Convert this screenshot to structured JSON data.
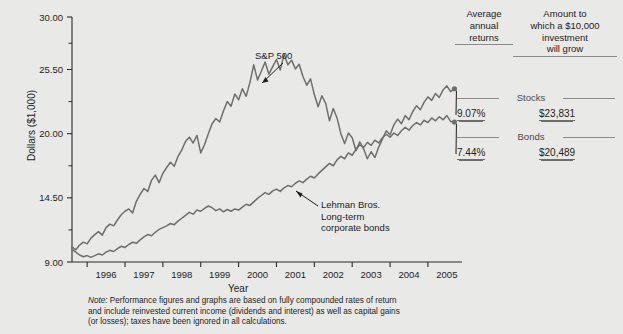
{
  "figure": {
    "background_color": "#e9e9e7",
    "line_color": "#6e6e6e",
    "axis_color": "#2a2a2a"
  },
  "annotations": {
    "sp500": {
      "text": "S&P 500"
    },
    "bonds": {
      "line1": "Lehman Bros.",
      "line2": "Long-term",
      "line3": "corporate bonds"
    }
  },
  "panel": {
    "headers": {
      "returns": {
        "line1": "Average",
        "line2": "annual",
        "line3": "returns"
      },
      "growth": {
        "line1": "Amount to",
        "line2": "which a $10,000",
        "line3": "investment",
        "line4": "will grow"
      }
    },
    "rows": [
      {
        "name": "Stocks",
        "return": "9.07%",
        "amount": "$23,831"
      },
      {
        "name": "Bonds",
        "return": "7.44%",
        "amount": "$20,489"
      }
    ]
  },
  "footnote": {
    "lead": "Note:",
    "line1": " Performance figures and graphs are based on fully compounded rates of return",
    "line2": "and include reinvested current income (dividends and interest) as well as capital gains",
    "line3": "(or losses); taxes have been ignored in all calculations."
  },
  "chart_data": {
    "type": "line",
    "title": "",
    "xlabel": "Year",
    "ylabel": "Dollars ($1,000)",
    "xlim": [
      1995.6,
      2005.9
    ],
    "ylim": [
      9.0,
      30.0
    ],
    "yticks": [
      9.0,
      14.5,
      20.0,
      25.5,
      30.0
    ],
    "ytick_labels": [
      "9.00",
      "14.50",
      "20.00",
      "25.50",
      "30.00"
    ],
    "yminor_ticks": [
      11.75,
      17.25,
      22.75,
      27.75
    ],
    "xticks": [
      1996,
      1997,
      1998,
      1999,
      2000,
      2001,
      2002,
      2003,
      2004,
      2005,
      2006
    ],
    "xtick_labels": [
      "1996",
      "1997",
      "1998",
      "1999",
      "2000",
      "2001",
      "2002",
      "2003",
      "2004",
      "2005"
    ],
    "grid": false,
    "legend": "annotated-inline",
    "series": [
      {
        "name": "S&P 500",
        "color": "#6e6e6e",
        "end_marker": true,
        "x": [
          1995.6,
          1995.7,
          1995.8,
          1995.9,
          1996.0,
          1996.1,
          1996.2,
          1996.3,
          1996.4,
          1996.5,
          1996.6,
          1996.7,
          1996.8,
          1996.9,
          1997.0,
          1997.1,
          1997.2,
          1997.3,
          1997.4,
          1997.5,
          1997.6,
          1997.7,
          1997.8,
          1997.9,
          1998.0,
          1998.1,
          1998.2,
          1998.3,
          1998.4,
          1998.5,
          1998.6,
          1998.7,
          1998.8,
          1998.9,
          1999.0,
          1999.1,
          1999.2,
          1999.3,
          1999.4,
          1999.5,
          1999.6,
          1999.7,
          1999.8,
          1999.9,
          2000.0,
          2000.1,
          2000.2,
          2000.3,
          2000.4,
          2000.5,
          2000.6,
          2000.7,
          2000.8,
          2000.9,
          2001.0,
          2001.1,
          2001.2,
          2001.3,
          2001.4,
          2001.5,
          2001.6,
          2001.7,
          2001.8,
          2001.9,
          2002.0,
          2002.1,
          2002.2,
          2002.3,
          2002.4,
          2002.5,
          2002.6,
          2002.7,
          2002.8,
          2002.9,
          2003.0,
          2003.1,
          2003.2,
          2003.3,
          2003.4,
          2003.5,
          2003.6,
          2003.7,
          2003.8,
          2003.9,
          2004.0,
          2004.1,
          2004.2,
          2004.3,
          2004.4,
          2004.5,
          2004.6,
          2004.7,
          2004.8,
          2004.9,
          2005.0,
          2005.1,
          2005.2,
          2005.3,
          2005.4,
          2005.5,
          2005.6,
          2005.7
        ],
        "y": [
          10.3,
          10.05,
          10.45,
          10.7,
          10.55,
          11.05,
          11.35,
          11.6,
          11.3,
          11.95,
          12.25,
          12.1,
          12.6,
          13.05,
          13.35,
          13.55,
          13.2,
          14.2,
          14.8,
          15.3,
          15.05,
          16.0,
          16.45,
          15.8,
          16.6,
          17.1,
          17.55,
          17.2,
          18.05,
          18.6,
          19.35,
          19.7,
          19.2,
          19.85,
          18.35,
          19.05,
          20.0,
          20.85,
          21.3,
          21.0,
          21.95,
          22.75,
          22.35,
          23.4,
          22.9,
          23.85,
          23.2,
          24.4,
          25.9,
          24.6,
          25.35,
          26.15,
          25.1,
          25.75,
          26.35,
          25.45,
          26.8,
          25.9,
          26.3,
          25.55,
          25.95,
          24.9,
          24.15,
          24.7,
          23.35,
          22.3,
          23.25,
          22.6,
          21.1,
          22.15,
          21.35,
          20.0,
          19.15,
          20.05,
          19.65,
          18.55,
          19.3,
          18.7,
          17.85,
          18.45,
          17.95,
          18.85,
          19.55,
          20.25,
          19.9,
          20.75,
          21.25,
          20.85,
          21.55,
          21.2,
          21.9,
          22.4,
          22.05,
          22.7,
          23.15,
          22.85,
          23.45,
          23.1,
          23.75,
          24.1,
          23.6,
          23.85
        ]
      },
      {
        "name": "Lehman Bros. Long-term corporate bonds",
        "color": "#6e6e6e",
        "end_marker": true,
        "x": [
          1995.6,
          1995.7,
          1995.8,
          1995.9,
          1996.0,
          1996.1,
          1996.2,
          1996.3,
          1996.4,
          1996.5,
          1996.6,
          1996.7,
          1996.8,
          1996.9,
          1997.0,
          1997.1,
          1997.2,
          1997.3,
          1997.4,
          1997.5,
          1997.6,
          1997.7,
          1997.8,
          1997.9,
          1998.0,
          1998.1,
          1998.2,
          1998.3,
          1998.4,
          1998.5,
          1998.6,
          1998.7,
          1998.8,
          1998.9,
          1999.0,
          1999.1,
          1999.2,
          1999.3,
          1999.4,
          1999.5,
          1999.6,
          1999.7,
          1999.8,
          1999.9,
          2000.0,
          2000.1,
          2000.2,
          2000.3,
          2000.4,
          2000.5,
          2000.6,
          2000.7,
          2000.8,
          2000.9,
          2001.0,
          2001.1,
          2001.2,
          2001.3,
          2001.4,
          2001.5,
          2001.6,
          2001.7,
          2001.8,
          2001.9,
          2002.0,
          2002.1,
          2002.2,
          2002.3,
          2002.4,
          2002.5,
          2002.6,
          2002.7,
          2002.8,
          2002.9,
          2003.0,
          2003.1,
          2003.2,
          2003.3,
          2003.4,
          2003.5,
          2003.6,
          2003.7,
          2003.8,
          2003.9,
          2004.0,
          2004.1,
          2004.2,
          2004.3,
          2004.4,
          2004.5,
          2004.6,
          2004.7,
          2004.8,
          2004.9,
          2005.0,
          2005.1,
          2005.2,
          2005.3,
          2005.4,
          2005.5,
          2005.6,
          2005.7
        ],
        "y": [
          10.1,
          9.85,
          9.6,
          9.45,
          9.55,
          9.4,
          9.55,
          9.7,
          9.6,
          9.85,
          10.0,
          9.9,
          10.15,
          10.35,
          10.25,
          10.5,
          10.7,
          10.6,
          10.9,
          11.15,
          11.35,
          11.25,
          11.55,
          11.8,
          11.95,
          12.1,
          12.3,
          12.2,
          12.5,
          12.75,
          13.0,
          13.25,
          13.1,
          13.45,
          13.35,
          13.6,
          13.8,
          13.65,
          13.4,
          13.55,
          13.3,
          13.5,
          13.35,
          13.55,
          13.45,
          13.7,
          13.95,
          13.85,
          14.15,
          14.45,
          14.7,
          14.95,
          14.8,
          15.1,
          15.25,
          15.05,
          15.35,
          15.55,
          15.45,
          15.75,
          15.95,
          15.8,
          16.1,
          16.35,
          16.2,
          16.55,
          16.85,
          17.15,
          17.45,
          17.25,
          17.75,
          18.05,
          17.85,
          18.35,
          18.15,
          18.65,
          19.05,
          18.8,
          19.25,
          19.0,
          19.45,
          19.2,
          19.65,
          19.95,
          19.7,
          20.05,
          19.85,
          20.25,
          20.55,
          20.3,
          20.7,
          20.95,
          20.75,
          21.15,
          20.95,
          21.35,
          21.1,
          21.45,
          21.2,
          21.55,
          21.05,
          21.0
        ]
      }
    ]
  }
}
